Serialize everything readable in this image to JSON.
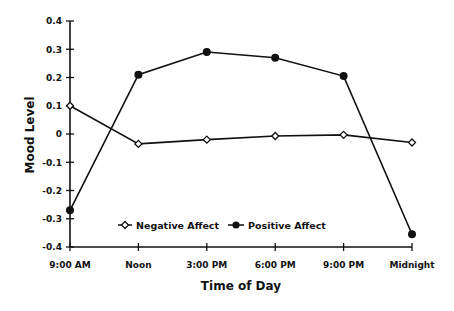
{
  "chart_data": {
    "type": "line",
    "title": "",
    "xlabel": "Time of Day",
    "ylabel": "Mood Level",
    "categories": [
      "9:00 AM",
      "Noon",
      "3:00 PM",
      "6:00 PM",
      "9:00 PM",
      "Midnight"
    ],
    "ylim": [
      -0.4,
      0.4
    ],
    "yticks": [
      0.4,
      0.3,
      0.2,
      0.1,
      0,
      -0.1,
      -0.2,
      -0.3,
      -0.4
    ],
    "ytick_labels": [
      "0.4",
      "0.3",
      "0.2",
      "0.1",
      "0",
      "-0.1",
      "-0.2",
      "-0.3",
      "-0.4"
    ],
    "grid": false,
    "legend_position": "inside-bottom-center",
    "series": [
      {
        "name": "Negative Affect",
        "marker": "open-diamond",
        "values": [
          0.1,
          -0.035,
          -0.02,
          -0.007,
          -0.003,
          -0.03
        ]
      },
      {
        "name": "Positive Affect",
        "marker": "filled-circle",
        "values": [
          -0.27,
          0.21,
          0.29,
          0.27,
          0.205,
          -0.355
        ]
      }
    ]
  },
  "legend": {
    "negative_label": "Negative Affect",
    "positive_label": "Positive Affect"
  }
}
